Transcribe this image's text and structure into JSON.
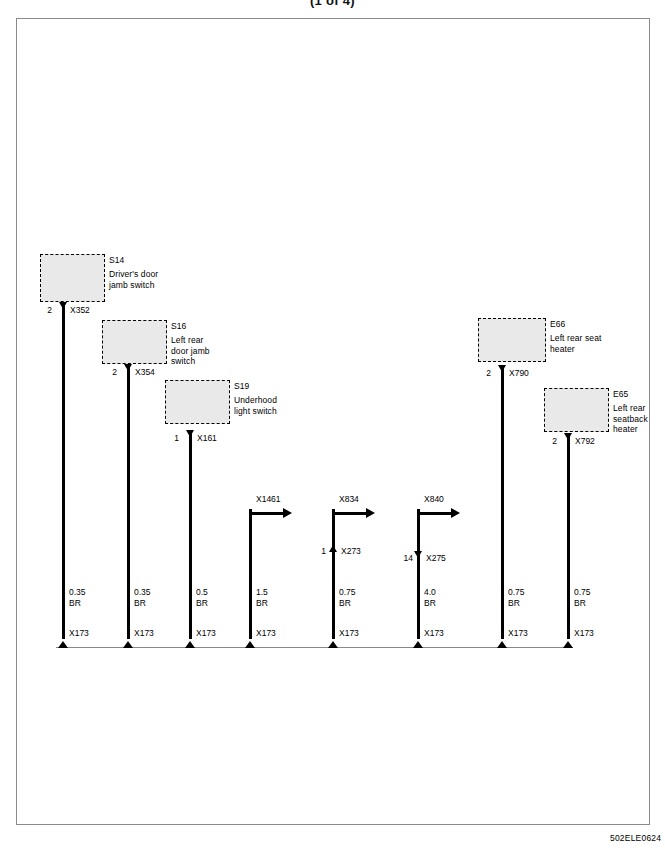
{
  "page": {
    "title": "(1 of 4)",
    "footer_code": "502ELE0624"
  },
  "components": [
    {
      "id": "S14",
      "description": "Driver's door\njamb switch",
      "pin": "2",
      "connector": "X352"
    },
    {
      "id": "S16",
      "description": "Left rear\ndoor jamb\nswitch",
      "pin": "2",
      "connector": "X354"
    },
    {
      "id": "S19",
      "description": "Underhood\nlight switch",
      "pin": "1",
      "connector": "X161"
    },
    {
      "id": "E66",
      "description": "Left rear seat\nheater",
      "pin": "2",
      "connector": "X790"
    },
    {
      "id": "E65",
      "description": "Left rear\nseatback\nheater",
      "pin": "2",
      "connector": "X792"
    }
  ],
  "inline_connectors": [
    {
      "name": "X1461"
    },
    {
      "name": "X834"
    },
    {
      "name": "X840"
    }
  ],
  "splice_connectors": [
    {
      "pin": "1",
      "name": "X273"
    },
    {
      "pin": "14",
      "name": "X275"
    }
  ],
  "wires": [
    {
      "gauge": "0.35",
      "color": "BR",
      "ground": "X173"
    },
    {
      "gauge": "0.35",
      "color": "BR",
      "ground": "X173"
    },
    {
      "gauge": "0.5",
      "color": "BR",
      "ground": "X173"
    },
    {
      "gauge": "1.5",
      "color": "BR",
      "ground": "X173"
    },
    {
      "gauge": "0.75",
      "color": "BR",
      "ground": "X173"
    },
    {
      "gauge": "4.0",
      "color": "BR",
      "ground": "X173"
    },
    {
      "gauge": "0.75",
      "color": "BR",
      "ground": "X173"
    },
    {
      "gauge": "0.75",
      "color": "BR",
      "ground": "X173"
    }
  ],
  "colors": {
    "wire": "#000000",
    "box_fill": "#e9e9e9",
    "frame": "#8a8a8a",
    "bus": "#888888"
  }
}
